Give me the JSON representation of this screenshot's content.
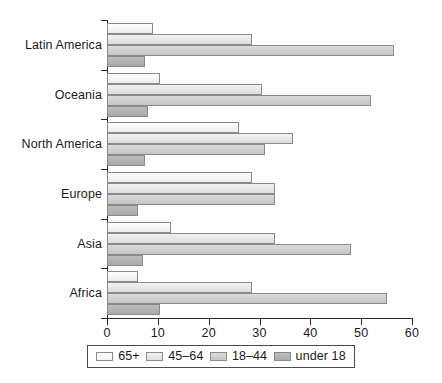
{
  "chart_data": {
    "type": "bar",
    "orientation": "horizontal",
    "title": "",
    "xlabel": "",
    "ylabel": "",
    "xlim": [
      0,
      60
    ],
    "xticks": [
      0,
      10,
      20,
      30,
      40,
      50,
      60
    ],
    "xticklabels": [
      "0",
      "10",
      "20",
      "30",
      "40",
      "50",
      "60"
    ],
    "grid": false,
    "legend_position": "bottom",
    "categories": [
      "Latin America",
      "Oceania",
      "North America",
      "Europe",
      "Asia",
      "Africa"
    ],
    "series": [
      {
        "name": "65+",
        "values": [
          9.0,
          10.5,
          26.0,
          28.5,
          12.5,
          6.0
        ]
      },
      {
        "name": "45–64",
        "values": [
          28.5,
          30.5,
          36.5,
          33.0,
          33.0,
          28.5
        ]
      },
      {
        "name": "18–44",
        "values": [
          56.5,
          52.0,
          31.0,
          33.0,
          48.0,
          55.0
        ]
      },
      {
        "name": "under 18",
        "values": [
          7.5,
          8.0,
          7.5,
          6.0,
          7.0,
          10.5
        ]
      }
    ]
  },
  "legend": {
    "items": [
      {
        "label": "65+"
      },
      {
        "label": "45–64"
      },
      {
        "label": "18–44"
      },
      {
        "label": "under 18"
      }
    ]
  },
  "colors": {
    "series_65_plus": "#ffffff",
    "series_45_64": "#e8e8e8",
    "series_18_44": "#cfcfcf",
    "series_under_18": "#b2b2b2",
    "axis": "#2b2b2b",
    "bar_outline": "#8a8a8a",
    "text": "#1a1a1a",
    "background": "#ffffff"
  }
}
